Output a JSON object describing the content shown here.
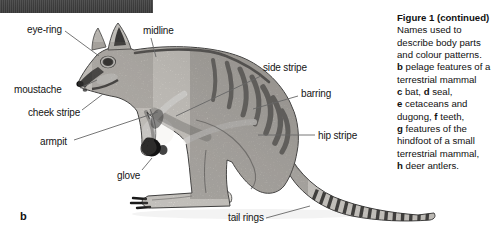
{
  "colors": {
    "top_bar": "#424242",
    "ink": "#141414",
    "leader_line": "#666666",
    "body_fill": "#e9e6e1"
  },
  "panel": {
    "letter": "b"
  },
  "figure": {
    "labels": [
      {
        "id": "eye-ring",
        "text": "eye-ring"
      },
      {
        "id": "midline",
        "text": "midline"
      },
      {
        "id": "moustache",
        "text": "moustache"
      },
      {
        "id": "cheek-stripe",
        "text": "cheek stripe"
      },
      {
        "id": "armpit",
        "text": "armpit"
      },
      {
        "id": "glove",
        "text": "glove"
      },
      {
        "id": "side-stripe",
        "text": "side stripe"
      },
      {
        "id": "barring",
        "text": "barring"
      },
      {
        "id": "hip-stripe",
        "text": "hip stripe"
      },
      {
        "id": "tail-rings",
        "text": "tail rings"
      }
    ],
    "caption": {
      "heading": "Figure 1 (continued)",
      "lines": [
        [
          {
            "t": "Names used to"
          }
        ],
        [
          {
            "t": "describe body parts"
          }
        ],
        [
          {
            "t": "and colour patterns."
          }
        ],
        [
          {
            "t": "b",
            "b": true
          },
          {
            "t": " pelage features of a"
          }
        ],
        [
          {
            "t": "terrestrial mammal"
          }
        ],
        [
          {
            "t": "c",
            "b": true
          },
          {
            "t": " bat, "
          },
          {
            "t": "d",
            "b": true
          },
          {
            "t": " seal,"
          }
        ],
        [
          {
            "t": "e",
            "b": true
          },
          {
            "t": " cetaceans and"
          }
        ],
        [
          {
            "t": "dugong, "
          },
          {
            "t": "f",
            "b": true
          },
          {
            "t": " teeth,"
          }
        ],
        [
          {
            "t": "g",
            "b": true
          },
          {
            "t": " features of the"
          }
        ],
        [
          {
            "t": "hindfoot of a small"
          }
        ],
        [
          {
            "t": "terrestrial mammal,"
          }
        ],
        [
          {
            "t": "h",
            "b": true
          },
          {
            "t": " deer antlers."
          }
        ]
      ]
    }
  }
}
